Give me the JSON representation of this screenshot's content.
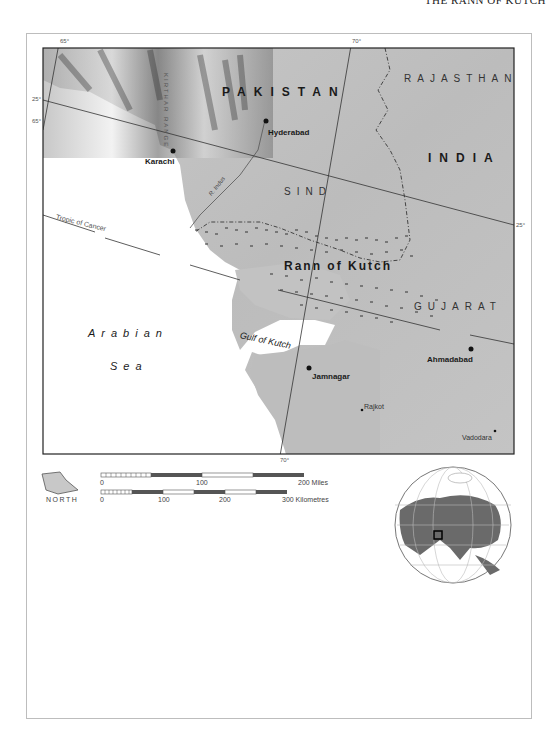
{
  "running_head": "THE RANN OF KUTCH",
  "map": {
    "graticule": {
      "top_65": "65°",
      "top_70": "70°",
      "left_25": "25°",
      "left_65": "65°",
      "right_25": "25°",
      "bottom_70": "70°",
      "tropic": "Tropic of Cancer"
    },
    "countries": [
      "PAKISTAN",
      "INDIA"
    ],
    "regions": [
      "RAJASTHAN",
      "SIND",
      "GUJARAT"
    ],
    "range": "KIRTHAR RANGE",
    "river": "R. Indus",
    "feature": "Rann of Kutch",
    "gulf": "Gulf of Kutch",
    "sea": [
      "Arabian",
      "Sea"
    ],
    "cities": {
      "major": [
        "Hyderabad",
        "Karachi",
        "Ahmadabad",
        "Jamnagar"
      ],
      "minor": [
        "Rajkot",
        "Vadodara"
      ]
    }
  },
  "legend": {
    "north_label": "NORTH",
    "miles": {
      "ticks": [
        "0",
        "100",
        "200 Miles"
      ]
    },
    "kilometres": {
      "ticks": [
        "0",
        "100",
        "200",
        "300 Kilometres"
      ]
    }
  },
  "locator_globe": {
    "highlight": "Rann of Kutch region"
  },
  "colors": {
    "land": "#b8b8b8",
    "sea": "#ffffff",
    "ink": "#1a1a1a",
    "globe_land": "#6a6a6a"
  }
}
